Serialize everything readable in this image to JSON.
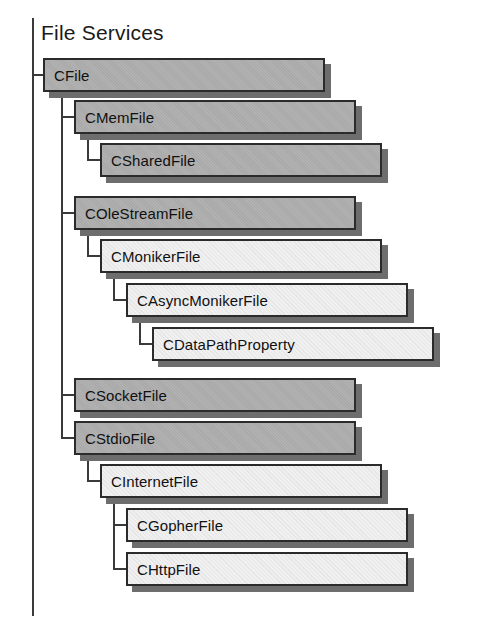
{
  "diagram": {
    "title": "File Services",
    "type": "class-hierarchy",
    "colors": {
      "box_gray_fill": "#a9a9a9",
      "box_white_fill": "#f0f0f0",
      "box_border": "#2b2b2b",
      "shadow": "#6d6d6d",
      "connector": "#3a3a3a",
      "background": "#ffffff",
      "text": "#101010"
    },
    "spine": {
      "x": 32,
      "y": 18,
      "height": 598
    },
    "metrics": {
      "box_height": 34,
      "box_width": 282,
      "row_pitch": 36,
      "indent_step": 26,
      "shadow_offset": 6
    },
    "nodes": [
      {
        "id": "cfile",
        "label": "CFile",
        "level": 0,
        "fill": "gray",
        "x": 43,
        "y": 58,
        "width": 282
      },
      {
        "id": "cmemfile",
        "label": "CMemFile",
        "level": 1,
        "fill": "gray",
        "x": 74,
        "y": 100,
        "width": 282
      },
      {
        "id": "csharedfile",
        "label": "CSharedFile",
        "level": 2,
        "fill": "gray",
        "x": 100,
        "y": 143,
        "width": 282
      },
      {
        "id": "colestreamfile",
        "label": "COleStreamFile",
        "level": 1,
        "fill": "gray",
        "x": 74,
        "y": 196,
        "width": 282
      },
      {
        "id": "cmonikerfile",
        "label": "CMonikerFile",
        "level": 2,
        "fill": "white",
        "x": 100,
        "y": 239,
        "width": 282
      },
      {
        "id": "casyncmonikerfile",
        "label": "CAsyncMonikerFile",
        "level": 3,
        "fill": "white",
        "x": 126,
        "y": 283,
        "width": 282
      },
      {
        "id": "cdatapathproperty",
        "label": "CDataPathProperty",
        "level": 4,
        "fill": "white",
        "x": 152,
        "y": 327,
        "width": 282
      },
      {
        "id": "csocketfile",
        "label": "CSocketFile",
        "level": 1,
        "fill": "gray",
        "x": 74,
        "y": 378,
        "width": 282
      },
      {
        "id": "cstdiofile",
        "label": "CStdioFile",
        "level": 1,
        "fill": "gray",
        "x": 74,
        "y": 421,
        "width": 282
      },
      {
        "id": "cinternetfile",
        "label": "CInternetFile",
        "level": 2,
        "fill": "white",
        "x": 100,
        "y": 464,
        "width": 282
      },
      {
        "id": "cgopherfile",
        "label": "CGopherFile",
        "level": 3,
        "fill": "white",
        "x": 126,
        "y": 508,
        "width": 282
      },
      {
        "id": "chttpfile",
        "label": "CHttpFile",
        "level": 3,
        "fill": "white",
        "x": 126,
        "y": 552,
        "width": 282
      }
    ],
    "connectors": [
      {
        "id": "spine-to-cfile",
        "type": "h",
        "x": 32,
        "y": 74,
        "length": 13
      },
      {
        "id": "cfile-trunk",
        "type": "v",
        "x": 61,
        "y": 92,
        "length": 345
      },
      {
        "id": "cfile-to-cmemfile",
        "type": "h",
        "x": 61,
        "y": 116,
        "length": 15
      },
      {
        "id": "cfile-to-colestreamfile",
        "type": "h",
        "x": 61,
        "y": 212,
        "length": 15
      },
      {
        "id": "cfile-to-csocketfile",
        "type": "h",
        "x": 61,
        "y": 394,
        "length": 15
      },
      {
        "id": "cfile-to-cstdiofile",
        "type": "h",
        "x": 61,
        "y": 437,
        "length": 15
      },
      {
        "id": "cmemfile-trunk",
        "type": "v",
        "x": 87,
        "y": 134,
        "length": 26
      },
      {
        "id": "cmemfile-to-csharedfile",
        "type": "h",
        "x": 87,
        "y": 159,
        "length": 15
      },
      {
        "id": "colestream-trunk",
        "type": "v",
        "x": 87,
        "y": 230,
        "length": 26
      },
      {
        "id": "colestream-to-cmonikerfile",
        "type": "h",
        "x": 87,
        "y": 255,
        "length": 15
      },
      {
        "id": "cmonikerfile-trunk",
        "type": "v",
        "x": 113,
        "y": 273,
        "length": 27
      },
      {
        "id": "cmonikerfile-to-casync",
        "type": "h",
        "x": 113,
        "y": 299,
        "length": 15
      },
      {
        "id": "casync-trunk",
        "type": "v",
        "x": 139,
        "y": 317,
        "length": 27
      },
      {
        "id": "casync-to-cdatapath",
        "type": "h",
        "x": 139,
        "y": 343,
        "length": 15
      },
      {
        "id": "cstdiofile-trunk",
        "type": "v",
        "x": 87,
        "y": 455,
        "length": 26
      },
      {
        "id": "cstdiofile-to-cinternetfile",
        "type": "h",
        "x": 87,
        "y": 480,
        "length": 15
      },
      {
        "id": "cinternetfile-trunk",
        "type": "v",
        "x": 113,
        "y": 498,
        "length": 71
      },
      {
        "id": "cinternet-to-cgopherfile",
        "type": "h",
        "x": 113,
        "y": 524,
        "length": 15
      },
      {
        "id": "cinternet-to-chttpfile",
        "type": "h",
        "x": 113,
        "y": 568,
        "length": 15
      }
    ]
  }
}
